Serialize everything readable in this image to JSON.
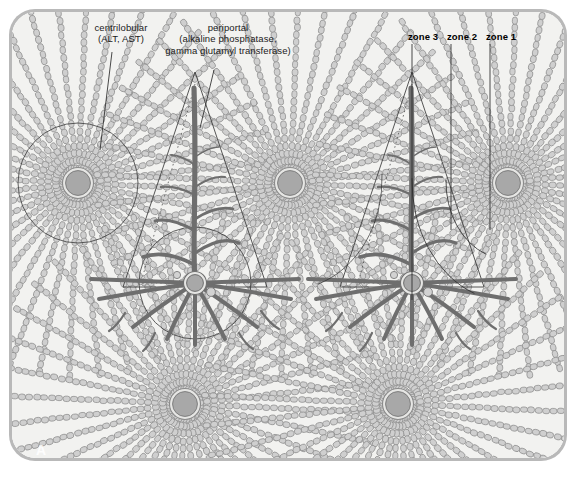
{
  "figure": {
    "panel_letter": "A",
    "background_color": "#f2f2f0",
    "frame_color": "#b9b9b9",
    "cord_fill": "#cfcfcf",
    "cord_stroke": "#8a8a8a",
    "vessel_color": "#6e6e6e",
    "vein_fill": "#a8a8a8",
    "outline_color": "#3a3a3a"
  },
  "annotations": {
    "centrilobular": {
      "line1": "centrilobular",
      "line2": "(ALT, AST)"
    },
    "periportal": {
      "line1": "periportal",
      "line2": "(alkaline phosphatase,",
      "line3": "gamma glutamyl transferase)"
    },
    "zones": [
      {
        "label": "zone 3"
      },
      {
        "label": "zone 2"
      },
      {
        "label": "zone 1"
      }
    ]
  },
  "structures": {
    "central_veins": [
      {
        "name": "central-vein-top-left",
        "cx": 78,
        "cy": 183
      },
      {
        "name": "central-vein-top-middle",
        "cx": 290,
        "cy": 183
      },
      {
        "name": "central-vein-top-right",
        "cx": 508,
        "cy": 183
      },
      {
        "name": "central-vein-bottom-left",
        "cx": 185,
        "cy": 404
      },
      {
        "name": "central-vein-bottom-right",
        "cx": 398,
        "cy": 404
      }
    ],
    "portal_tracts": [
      {
        "name": "portal-tract-left",
        "cx": 195,
        "cy": 283,
        "apex_y": 72
      },
      {
        "name": "portal-tract-right",
        "cx": 412,
        "cy": 283,
        "apex_y": 72
      }
    ]
  }
}
